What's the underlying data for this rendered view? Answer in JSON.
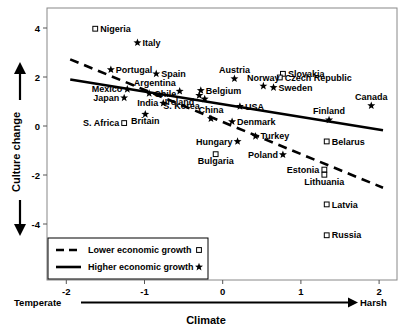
{
  "chart_data": {
    "type": "scatter",
    "title": "",
    "xlabel": "Climate",
    "ylabel": "Culture change",
    "xlim": [
      -2.25,
      2.25
    ],
    "ylim": [
      -5.1,
      4.6
    ],
    "xticks": [
      -2,
      -1,
      0,
      1,
      2
    ],
    "xticklabels": [
      "-2",
      "-1",
      "0",
      "1",
      "2"
    ],
    "yticks": [
      4,
      2,
      0,
      -2,
      -4
    ],
    "yticklabels": [
      "4",
      "2",
      "0",
      "-2",
      "-4"
    ],
    "grid": false,
    "x_axis_left_end_label": "Temperate",
    "x_axis_right_end_label": "Harsh",
    "legend_position": "lower-left",
    "series": [
      {
        "name": "Lower economic growth",
        "marker": "square",
        "trendline": {
          "x0": -1.95,
          "y0": 2.72,
          "x1": 2.05,
          "y1": -2.52,
          "style": "dashed"
        },
        "points": [
          {
            "label": "Nigeria",
            "x": -1.63,
            "y": 3.97,
            "label_pos": "right"
          },
          {
            "label": "S. Africa",
            "x": -1.26,
            "y": 0.12,
            "label_pos": "left"
          },
          {
            "label": "Bulgaria",
            "x": -0.09,
            "y": -1.15,
            "label_pos": "below"
          },
          {
            "label": "Slovakia",
            "x": 0.77,
            "y": 2.13,
            "label_pos": "right"
          },
          {
            "label": "Czech Republic",
            "x": 0.73,
            "y": 1.98,
            "label_pos": "right"
          },
          {
            "label": "Belarus",
            "x": 1.33,
            "y": -0.63,
            "label_pos": "right"
          },
          {
            "label": "Estonia",
            "x": 1.3,
            "y": -1.78,
            "label_pos": "left"
          },
          {
            "label": "Lithuania",
            "x": 1.3,
            "y": -1.99,
            "label_pos": "below"
          },
          {
            "label": "Latvia",
            "x": 1.33,
            "y": -3.2,
            "label_pos": "right"
          },
          {
            "label": "Russia",
            "x": 1.33,
            "y": -4.46,
            "label_pos": "right"
          }
        ]
      },
      {
        "name": "Higher economic growth",
        "marker": "star",
        "trendline": {
          "x0": -1.95,
          "y0": 1.9,
          "x1": 2.05,
          "y1": -0.17,
          "style": "solid"
        },
        "points": [
          {
            "label": "Italy",
            "x": -1.09,
            "y": 3.4,
            "label_pos": "right"
          },
          {
            "label": "Portugal",
            "x": -1.43,
            "y": 2.3,
            "label_pos": "right"
          },
          {
            "label": "Spain",
            "x": -0.85,
            "y": 2.13,
            "label_pos": "right"
          },
          {
            "label": "Mexico",
            "x": -1.22,
            "y": 1.5,
            "label_pos": "left"
          },
          {
            "label": "Japan",
            "x": -1.26,
            "y": 1.15,
            "label_pos": "left"
          },
          {
            "label": "Argentina",
            "x": -0.55,
            "y": 1.42,
            "label_pos": "above-left"
          },
          {
            "label": "Chile",
            "x": -0.94,
            "y": 1.33,
            "label_pos": "right"
          },
          {
            "label": "India",
            "x": -0.76,
            "y": 0.93,
            "label_pos": "left"
          },
          {
            "label": "Britain",
            "x": -0.99,
            "y": 0.48,
            "label_pos": "below"
          },
          {
            "label": "Ireland",
            "x": -0.3,
            "y": 1.25,
            "label_pos": "below-left"
          },
          {
            "label": "Belgium",
            "x": -0.28,
            "y": 1.45,
            "label_pos": "right"
          },
          {
            "label": "S. Korea",
            "x": -0.23,
            "y": 1.1,
            "label_pos": "below-left"
          },
          {
            "label": "China",
            "x": -0.15,
            "y": 0.3,
            "label_pos": "above"
          },
          {
            "label": "Austria",
            "x": 0.15,
            "y": 1.93,
            "label_pos": "above"
          },
          {
            "label": "Norway",
            "x": 0.52,
            "y": 1.63,
            "label_pos": "above"
          },
          {
            "label": "Sweden",
            "x": 0.65,
            "y": 1.57,
            "label_pos": "right"
          },
          {
            "label": "USA",
            "x": 0.22,
            "y": 0.8,
            "label_pos": "right"
          },
          {
            "label": "Denmark",
            "x": 0.12,
            "y": 0.18,
            "label_pos": "right"
          },
          {
            "label": "Hungary",
            "x": 0.19,
            "y": -0.63,
            "label_pos": "left"
          },
          {
            "label": "Turkey",
            "x": 0.42,
            "y": -0.42,
            "label_pos": "right"
          },
          {
            "label": "Poland",
            "x": 0.77,
            "y": -1.17,
            "label_pos": "left"
          },
          {
            "label": "Finland",
            "x": 1.36,
            "y": 0.25,
            "label_pos": "above"
          },
          {
            "label": "Canada",
            "x": 1.9,
            "y": 0.83,
            "label_pos": "above"
          }
        ]
      }
    ],
    "legend_entries": [
      {
        "label": "Lower economic growth",
        "line": "dashed",
        "marker": "square"
      },
      {
        "label": "Higher economic growth",
        "line": "solid",
        "marker": "star"
      }
    ]
  }
}
